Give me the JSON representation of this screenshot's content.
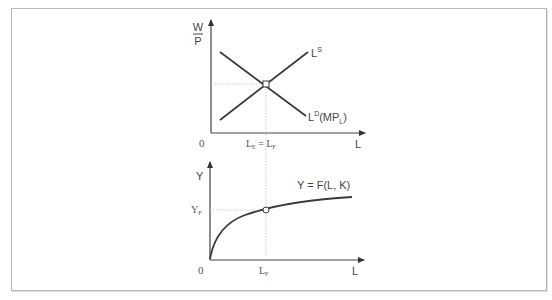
{
  "figure": {
    "type": "labor-market-and-production-function-diagram",
    "top_panel": {
      "y_axis_label_numerator": "W",
      "y_axis_label_denominator": "P",
      "x_axis_label": "L",
      "origin_label": "0",
      "supply_curve_label": "L",
      "supply_curve_sup": "S",
      "demand_curve_label": "L",
      "demand_curve_sup": "D",
      "demand_curve_suffix_open": "(MP",
      "demand_curve_suffix_sub": "L",
      "demand_curve_suffix_close": ")",
      "equilibrium_label_main1": "L",
      "equilibrium_label_sub1": "E",
      "equilibrium_label_eq": " = ",
      "equilibrium_label_main2": "L",
      "equilibrium_label_sub2": "F"
    },
    "bottom_panel": {
      "y_axis_label": "Y",
      "x_axis_label": "L",
      "origin_label": "0",
      "curve_label": "Y = F(L,  K)",
      "y_tick_main": "Y",
      "y_tick_sub": "F",
      "x_tick_main": "L",
      "x_tick_sub": "F"
    },
    "colors": {
      "curve": "#3a3a3a",
      "axis": "#444444",
      "guide": "#bdbdbd",
      "frame": "#b8b8b8"
    }
  }
}
